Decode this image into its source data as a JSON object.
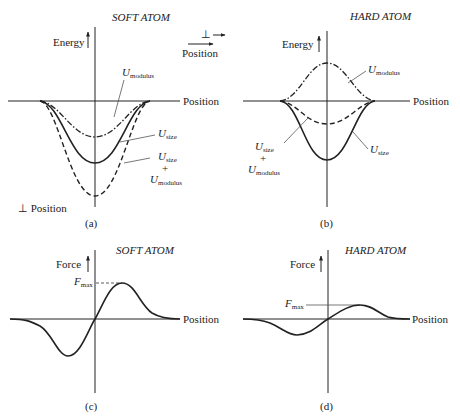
{
  "panels": {
    "a": {
      "title": "SOFT ATOM",
      "caption": "(a)",
      "y_axis_label": "Energy",
      "x_axis_label": "Position",
      "perp_label": "⊥ Position",
      "curves": {
        "modulus": {
          "name": "U",
          "sub": "modulus"
        },
        "size": {
          "name": "U",
          "sub": "size"
        },
        "sum": {
          "name1": "U",
          "sub1": "size",
          "plus": "+",
          "name2": "U",
          "sub2": "modulus"
        }
      }
    },
    "b": {
      "title": "HARD ATOM",
      "caption": "(b)",
      "y_axis_label": "Energy",
      "x_axis_label": "Position",
      "curves": {
        "modulus": {
          "name": "U",
          "sub": "modulus"
        },
        "size": {
          "name": "U",
          "sub": "size"
        },
        "sum": {
          "name1": "U",
          "sub1": "size",
          "plus": "+",
          "name2": "U",
          "sub2": "modulus"
        }
      }
    },
    "c": {
      "title": "SOFT ATOM",
      "caption": "(c)",
      "y_axis_label": "Force",
      "x_axis_label": "Position",
      "fmax": {
        "name": "F",
        "sub": "max"
      }
    },
    "d": {
      "title": "HARD ATOM",
      "caption": "(d)",
      "y_axis_label": "Force",
      "x_axis_label": "Position",
      "fmax": {
        "name": "F",
        "sub": "max"
      }
    }
  },
  "legend": {
    "perp_symbol": "⊥",
    "arrow": "→",
    "position_label": "Position"
  }
}
